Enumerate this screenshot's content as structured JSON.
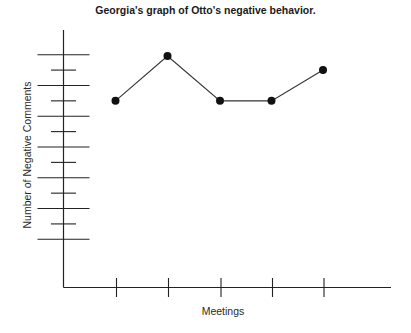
{
  "chart_data": {
    "type": "line",
    "title": "Georgia's graph of Otto's negative behavior.",
    "xlabel": "Meetings",
    "ylabel": "Number of Negative Comments",
    "categories": [
      "1",
      "2",
      "3",
      "4",
      "5"
    ],
    "x_tick_labels_visible": false,
    "y_tick_labels_visible": false,
    "series": [
      {
        "name": "Negative comments",
        "values": [
          10,
          13,
          10,
          10,
          12
        ]
      }
    ],
    "y_ticks_count": 13,
    "y_tick_style": "alternating long/short ticks crossing axis",
    "ylim": [
      0,
      15
    ],
    "grid": false,
    "legend": "none",
    "colors": {
      "line": "#333333",
      "marker": "#111111",
      "axis": "#222222"
    }
  }
}
